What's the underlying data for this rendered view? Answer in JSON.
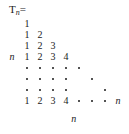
{
  "figure": {
    "title": {
      "symbol": "T",
      "subscript": "n",
      "equals": "="
    },
    "axis_labels": {
      "left": "n",
      "bottom": "n",
      "row_end": "n"
    },
    "grid": {
      "columns": 8,
      "rows": 8,
      "col_step_px": 13,
      "row_step_px": 11,
      "origin_x_px": 22,
      "origin_y_px": 19
    },
    "rows": [
      {
        "index": 1,
        "cells": [
          "1"
        ]
      },
      {
        "index": 2,
        "cells": [
          "1",
          "2"
        ]
      },
      {
        "index": 3,
        "cells": [
          "1",
          "2",
          "3"
        ]
      },
      {
        "index": 4,
        "cells": [
          "1",
          "2",
          "3",
          "4"
        ]
      },
      {
        "index": 5,
        "cells": [
          "dot",
          "dot",
          "dot",
          "dot",
          "dot"
        ]
      },
      {
        "index": 6,
        "cells": [
          "dot",
          "dot",
          "dot",
          "dot",
          "",
          "dot"
        ]
      },
      {
        "index": 7,
        "cells": [
          "dot",
          "dot",
          "dot",
          "dot",
          "",
          "",
          "dot"
        ]
      },
      {
        "index": 8,
        "cells": [
          "1",
          "2",
          "3",
          "4",
          "dot",
          "dot",
          "dot",
          "n"
        ]
      }
    ],
    "colors": {
      "ink": "#1a1a1a",
      "background": "#ffffff"
    }
  }
}
